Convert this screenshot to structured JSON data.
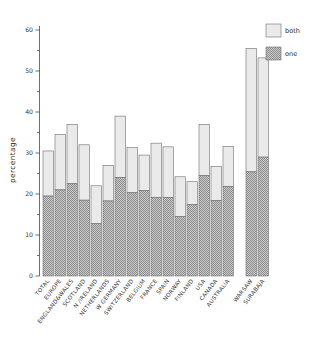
{
  "chart_data": {
    "type": "bar",
    "title": "",
    "subtitle": "",
    "xlabel": "",
    "ylabel": "percentage",
    "ylim": [
      0,
      60
    ],
    "yticks": [
      0,
      10,
      20,
      30,
      40,
      50,
      60
    ],
    "ytick_labels": [
      "0",
      "10",
      "20",
      "30",
      "40",
      "50",
      "60"
    ],
    "yminor_ticks": [
      5,
      15,
      25,
      35,
      45,
      55
    ],
    "grid": false,
    "stacked": true,
    "legend_position": "top-right",
    "legend": [
      "both",
      "one"
    ],
    "categories": [
      "TOTAL",
      "EUROPE",
      "ENGLAND&WALES",
      "SCOTLAND",
      "N /IRELAND",
      "NETHERLANDS",
      "W GERMANY",
      "SWITZERLAND",
      "BELGIUM",
      "FRANCE",
      "SPAIN",
      "NORWAY",
      "FINLAND",
      "USA",
      "CANADA",
      "AUSTRALIA",
      "WARSAW",
      "SURABAJA"
    ],
    "group_break_after_index": 15,
    "series": [
      {
        "name": "one",
        "fill": "#b8b8b8",
        "pattern": "stipple",
        "values": [
          19.5,
          21.0,
          22.5,
          18.5,
          12.8,
          18.3,
          24.0,
          20.3,
          20.8,
          19.2,
          19.2,
          14.5,
          17.4,
          24.5,
          18.4,
          21.8,
          25.4,
          29.0
        ]
      },
      {
        "name": "both",
        "fill": "#e8e8e8",
        "pattern": "plain",
        "values": [
          11.0,
          13.5,
          14.5,
          13.5,
          9.2,
          8.7,
          15.0,
          11.0,
          8.7,
          13.2,
          12.3,
          9.7,
          5.6,
          12.5,
          8.3,
          9.8,
          30.1,
          24.2
        ]
      }
    ],
    "totals": [
      30.5,
      34.5,
      37.0,
      32.0,
      22.0,
      27.0,
      39.0,
      31.3,
      29.5,
      32.4,
      31.5,
      24.2,
      23.0,
      37.0,
      26.7,
      31.6,
      55.5,
      53.2
    ]
  },
  "legend": {
    "items": [
      {
        "label": "both",
        "swatch": "plain"
      },
      {
        "label": "one",
        "swatch": "stipple"
      }
    ]
  },
  "axes": {
    "y_title": "percentage"
  },
  "colors": {
    "both_fill": "#e8e8e8",
    "one_fill": "#b8b8b8",
    "outline": "#6e6e6e",
    "axis": "#4a4a4a",
    "text": "#2e2e2e",
    "background": "#ffffff"
  }
}
